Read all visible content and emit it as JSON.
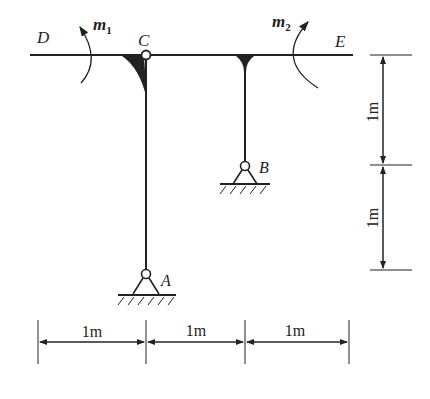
{
  "diagram": {
    "type": "structural frame",
    "nodes": {
      "D": "D",
      "C": "C",
      "E": "E",
      "A": "A",
      "B": "B"
    },
    "moments": {
      "m1": {
        "base": "m",
        "sub": "1"
      },
      "m2": {
        "base": "m",
        "sub": "2"
      }
    },
    "dimensions": {
      "horizontal": [
        "1m",
        "1m",
        "1m"
      ],
      "vertical": [
        "1m",
        "1m"
      ]
    },
    "colors": {
      "line": "#222222",
      "background": "#ffffff"
    }
  }
}
